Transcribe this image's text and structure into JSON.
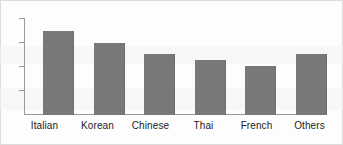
{
  "chart_data": {
    "type": "bar",
    "title": "",
    "subtitle": "",
    "xlabel": "",
    "ylabel": "",
    "categories": [
      "Italian",
      "Korean",
      "Chinese",
      "Thai",
      "French",
      "Others"
    ],
    "values": [
      3.5,
      3.0,
      2.55,
      2.3,
      2.05,
      2.55
    ],
    "ylim": [
      0,
      4
    ],
    "yticks": [
      1,
      2,
      3,
      4
    ],
    "ytick_labels": [
      "",
      "",
      "",
      ""
    ],
    "grid": false,
    "legend": null,
    "legend_position": "none",
    "bar_color": "#787878",
    "axis_color": "#9a9a9a",
    "background_color": "#fdfdfd",
    "annotations": []
  }
}
